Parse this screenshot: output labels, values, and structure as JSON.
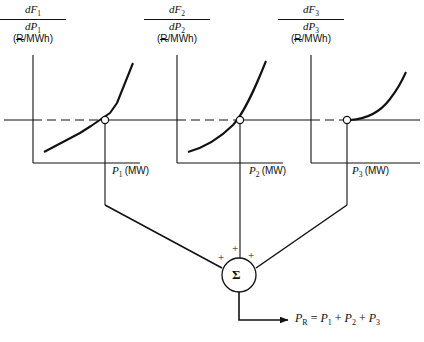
{
  "diagram": {
    "type": "engineering-block-diagram",
    "currency_symbol": "R",
    "currency_symbol_note": "R with horizontal strike",
    "background_color": "#ffffff",
    "line_color": "#111111"
  },
  "graphs": [
    {
      "id": "unit-1",
      "y_axis_label_numerator": "dF",
      "y_axis_label_numerator_sub": "1",
      "y_axis_label_denominator": "dP",
      "y_axis_label_denominator_sub": "1",
      "y_axis_units": "(R/MWh)",
      "x_axis_label": "P",
      "x_axis_label_sub": "1",
      "x_axis_units": "(MW)",
      "curve_style": "piecewise-linear",
      "operating_point_marker": "open-circle",
      "operating_point_on_lambda_line": true
    },
    {
      "id": "unit-2",
      "y_axis_label_numerator": "dF",
      "y_axis_label_numerator_sub": "2",
      "y_axis_label_denominator": "dP",
      "y_axis_label_denominator_sub": "2",
      "y_axis_units": "(R/MWh)",
      "x_axis_label": "P",
      "x_axis_label_sub": "2",
      "x_axis_units": "(MW)",
      "curve_style": "smooth-convex",
      "operating_point_marker": "open-circle",
      "operating_point_on_lambda_line": true
    },
    {
      "id": "unit-3",
      "y_axis_label_numerator": "dF",
      "y_axis_label_numerator_sub": "3",
      "y_axis_label_denominator": "dP",
      "y_axis_label_denominator_sub": "3",
      "y_axis_units": "(R/MWh)",
      "x_axis_label": "P",
      "x_axis_label_sub": "3",
      "x_axis_units": "(MW)",
      "curve_style": "smooth-convex-starting-at-limit",
      "operating_point_marker": "open-circle",
      "operating_point_on_lambda_line": true
    }
  ],
  "lambda_line": {
    "description": "common horizontal incremental-cost line across all three graphs",
    "style": "solid with dashed segment between each y-axis and operating point"
  },
  "summation": {
    "symbol": "Σ",
    "input_signs": [
      "+",
      "+",
      "+"
    ],
    "input_count": 3
  },
  "output": {
    "equation_lhs": "P",
    "equation_lhs_sub": "R",
    "equation_rel": "=",
    "term1": "P",
    "term1_sub": "1",
    "op1": "+",
    "term2": "P",
    "term2_sub": "2",
    "op2": "+",
    "term3": "P",
    "term3_sub": "3",
    "equation_plain": "P_R = P_1 + P_2 + P_3"
  }
}
